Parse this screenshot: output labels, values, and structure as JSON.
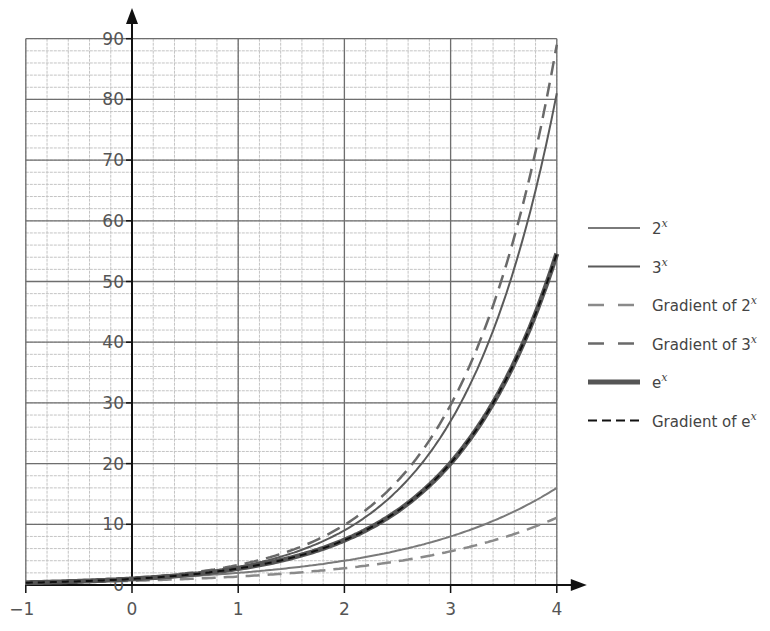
{
  "chart_data": {
    "type": "line",
    "title": "",
    "xlabel": "",
    "ylabel": "",
    "xlim": [
      -1,
      4
    ],
    "ylim": [
      0,
      90
    ],
    "grid": true,
    "x_ticks": [
      -1,
      0,
      1,
      2,
      3,
      4
    ],
    "x_tick_labels": [
      "−1",
      "0",
      "1",
      "2",
      "3",
      "4"
    ],
    "y_ticks": [
      0,
      10,
      20,
      30,
      40,
      50,
      60,
      70,
      80,
      90
    ],
    "y_tick_labels": [
      "0",
      "10",
      "20",
      "30",
      "40",
      "50",
      "60",
      "70",
      "80",
      "90"
    ],
    "minor_grid": {
      "x_step": 0.2,
      "y_step": 2
    },
    "legend_position": "right",
    "x": [
      -1,
      -0.5,
      0,
      0.5,
      1,
      1.5,
      2,
      2.5,
      3,
      3.5,
      4
    ],
    "series": [
      {
        "name": "2^x",
        "label_base": "2",
        "label_sup": "x",
        "style": "solid",
        "color": "#7a7a7a",
        "width": 2,
        "values": [
          0.5,
          0.71,
          1,
          1.41,
          2,
          2.83,
          4,
          5.66,
          8,
          11.31,
          16
        ]
      },
      {
        "name": "3^x",
        "label_base": "3",
        "label_sup": "x",
        "style": "solid",
        "color": "#5a5a5a",
        "width": 2,
        "values": [
          0.33,
          0.58,
          1,
          1.73,
          3,
          5.2,
          9,
          15.59,
          27,
          46.77,
          81
        ]
      },
      {
        "name": "Gradient of 2^x",
        "label_base": "Gradient of 2",
        "label_sup": "x",
        "style": "dashed",
        "color": "#8a8a8a",
        "width": 2.5,
        "values": [
          0.35,
          0.49,
          0.69,
          0.98,
          1.39,
          1.96,
          2.77,
          3.92,
          5.55,
          7.84,
          11.09
        ]
      },
      {
        "name": "Gradient of 3^x",
        "label_base": "Gradient of 3",
        "label_sup": "x",
        "style": "dashed",
        "color": "#6a6a6a",
        "width": 2.5,
        "values": [
          0.37,
          0.63,
          1.1,
          1.9,
          3.3,
          5.71,
          9.89,
          17.13,
          29.66,
          51.38,
          88.99
        ]
      },
      {
        "name": "e^x",
        "label_base": "e",
        "label_sup": "x",
        "style": "solid",
        "color": "#555555",
        "width": 5,
        "values": [
          0.37,
          0.61,
          1,
          1.65,
          2.72,
          4.48,
          7.39,
          12.18,
          20.09,
          33.12,
          54.6
        ]
      },
      {
        "name": "Gradient of e^x",
        "label_base": "Gradient of e",
        "label_sup": "x",
        "style": "dashed",
        "color": "#111111",
        "width": 2,
        "values": [
          0.37,
          0.61,
          1,
          1.65,
          2.72,
          4.48,
          7.39,
          12.18,
          20.09,
          33.12,
          54.6
        ]
      }
    ]
  },
  "layout": {
    "plot": {
      "x0px": 132,
      "xscale": 106.2,
      "y0px": 585,
      "yscale": 6.07
    },
    "legend": {
      "x": 588,
      "y_start": 228,
      "row_gap": 38.5,
      "line_len": 52,
      "text_x": 652
    }
  }
}
